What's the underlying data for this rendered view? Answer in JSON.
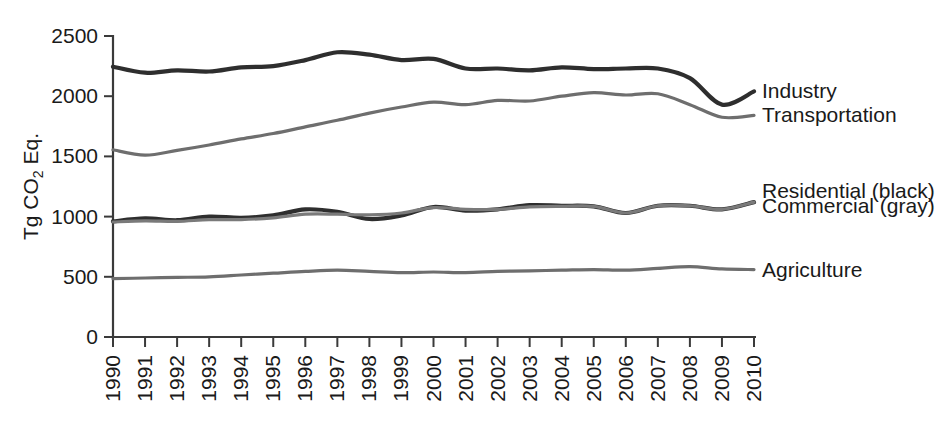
{
  "chart_data": {
    "type": "line",
    "title": "",
    "xlabel": "",
    "ylabel": "Tg CO2 Eq.",
    "ylabel_parts": {
      "prefix": "Tg CO",
      "sub": "2",
      "suffix": " Eq."
    },
    "x": [
      1990,
      1991,
      1992,
      1993,
      1994,
      1995,
      1996,
      1997,
      1998,
      1999,
      2000,
      2001,
      2002,
      2003,
      2004,
      2005,
      2006,
      2007,
      2008,
      2009,
      2010
    ],
    "xlim": [
      1990,
      2010
    ],
    "ylim": [
      0,
      2500
    ],
    "yticks": [
      0,
      500,
      1000,
      1500,
      2000,
      2500
    ],
    "xticks": [
      "1990",
      "1991",
      "1992",
      "1993",
      "1994",
      "1995",
      "1996",
      "1997",
      "1998",
      "1999",
      "2000",
      "2001",
      "2002",
      "2003",
      "2004",
      "2005",
      "2006",
      "2007",
      "2008",
      "2009",
      "2010"
    ],
    "grid": false,
    "legend_position": "right-inline",
    "series": [
      {
        "name": "Industry",
        "color": "#2e2e2e",
        "label": "Industry",
        "values": [
          2245,
          2195,
          2215,
          2205,
          2240,
          2250,
          2300,
          2365,
          2345,
          2300,
          2310,
          2230,
          2230,
          2215,
          2240,
          2225,
          2230,
          2230,
          2150,
          1930,
          2040
        ]
      },
      {
        "name": "Transportation",
        "color": "#6e6e6e",
        "label": "Transportation",
        "values": [
          1555,
          1510,
          1550,
          1595,
          1645,
          1690,
          1745,
          1800,
          1860,
          1910,
          1950,
          1930,
          1965,
          1960,
          2000,
          2030,
          2010,
          2020,
          1930,
          1825,
          1840
        ]
      },
      {
        "name": "Residential",
        "color": "#2e2e2e",
        "label": "Residential (black)",
        "values": [
          960,
          985,
          970,
          1000,
          990,
          1010,
          1060,
          1040,
          980,
          1010,
          1080,
          1050,
          1060,
          1095,
          1090,
          1085,
          1030,
          1090,
          1090,
          1060,
          1120
        ]
      },
      {
        "name": "Commercial",
        "color": "#7a7a7a",
        "label": "Commercial (gray)",
        "values": [
          955,
          965,
          960,
          975,
          975,
          990,
          1020,
          1020,
          1015,
          1030,
          1075,
          1060,
          1060,
          1080,
          1085,
          1085,
          1030,
          1090,
          1090,
          1060,
          1120
        ]
      },
      {
        "name": "Agriculture",
        "color": "#6e6e6e",
        "label": "Agriculture",
        "values": [
          485,
          490,
          495,
          500,
          515,
          530,
          545,
          555,
          545,
          535,
          540,
          535,
          545,
          550,
          555,
          560,
          555,
          570,
          585,
          565,
          560
        ]
      }
    ],
    "series_labels": [
      {
        "text": "Industry",
        "y_value": 2045
      },
      {
        "text": "Transportation",
        "y_value": 1845
      },
      {
        "text": "Residential (black)",
        "y_value": 1215
      },
      {
        "text": "Commercial (gray)",
        "y_value": 1090
      },
      {
        "text": "Agriculture",
        "y_value": 560
      }
    ],
    "colors": {
      "black_series": "#2e2e2e",
      "gray_series": "#6e6e6e",
      "axis": "#3a3a3a",
      "background": "#ffffff"
    }
  }
}
